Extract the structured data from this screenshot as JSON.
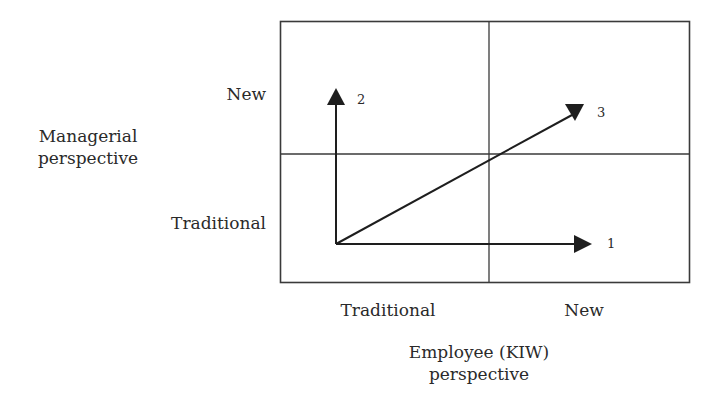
{
  "diagram": {
    "type": "2x2-matrix",
    "y_axis": {
      "title_line1": "Managerial",
      "title_line2": "perspective",
      "ticks": {
        "top": "New",
        "bottom": "Traditional"
      }
    },
    "x_axis": {
      "title_line1": "Employee (KIW)",
      "title_line2": "perspective",
      "ticks": {
        "left": "Traditional",
        "right": "New"
      }
    },
    "arrows": [
      {
        "id": "1",
        "label": "1",
        "direction": "horizontal",
        "from": "Traditional/Traditional",
        "to": "New employee perspective"
      },
      {
        "id": "2",
        "label": "2",
        "direction": "vertical",
        "from": "Traditional/Traditional",
        "to": "New managerial perspective"
      },
      {
        "id": "3",
        "label": "3",
        "direction": "diagonal",
        "from": "Traditional/Traditional",
        "to": "New/New"
      }
    ],
    "colors": {
      "line": "#2a2a2a",
      "background": "#ffffff"
    }
  }
}
